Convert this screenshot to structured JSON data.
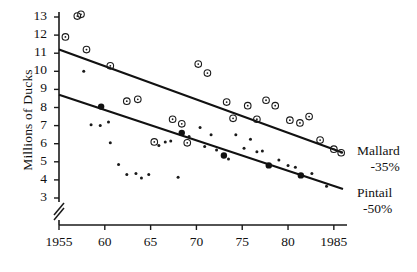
{
  "chart_data": {
    "type": "scatter",
    "title": "",
    "xlabel": "",
    "ylabel": "Millions of Ducks",
    "xlim": [
      1955,
      1986
    ],
    "ylim": [
      3,
      13
    ],
    "ybreak_below": 3,
    "grid": false,
    "legend_position": "right",
    "xticks": [
      {
        "value": 1955,
        "label": "1955"
      },
      {
        "value": 1960,
        "label": "60"
      },
      {
        "value": 1965,
        "label": "65"
      },
      {
        "value": 1970,
        "label": "70"
      },
      {
        "value": 1975,
        "label": "75"
      },
      {
        "value": 1980,
        "label": "80"
      },
      {
        "value": 1985,
        "label": "1985"
      }
    ],
    "yticks": [
      {
        "value": 13,
        "label": "13"
      },
      {
        "value": 12,
        "label": "12"
      },
      {
        "value": 11,
        "label": "11"
      },
      {
        "value": 10,
        "label": "10"
      },
      {
        "value": 9,
        "label": "9"
      },
      {
        "value": 8,
        "label": "8"
      },
      {
        "value": 7,
        "label": "7"
      },
      {
        "value": 6,
        "label": "6"
      },
      {
        "value": 5,
        "label": "5"
      },
      {
        "value": 4,
        "label": "4"
      },
      {
        "value": 3,
        "label": "3"
      }
    ],
    "series": [
      {
        "name": "Mallard",
        "marker": "open-circle",
        "annotation": "-35%",
        "legend_label": "Mallard",
        "legend_value": "-35%",
        "trend": {
          "x0": 1955,
          "y0": 11.2,
          "x1": 1986,
          "y1": 5.5,
          "style": "solid"
        },
        "points": [
          {
            "x": 1955.7,
            "y": 11.9
          },
          {
            "x": 1957.0,
            "y": 13.05
          },
          {
            "x": 1957.4,
            "y": 13.15
          },
          {
            "x": 1958.0,
            "y": 11.2
          },
          {
            "x": 1960.6,
            "y": 10.3
          },
          {
            "x": 1962.4,
            "y": 8.35
          },
          {
            "x": 1963.6,
            "y": 8.45
          },
          {
            "x": 1965.4,
            "y": 6.1
          },
          {
            "x": 1967.4,
            "y": 7.35
          },
          {
            "x": 1968.4,
            "y": 7.1
          },
          {
            "x": 1969.0,
            "y": 6.05
          },
          {
            "x": 1970.2,
            "y": 10.4
          },
          {
            "x": 1971.2,
            "y": 9.9
          },
          {
            "x": 1973.3,
            "y": 8.3
          },
          {
            "x": 1974.0,
            "y": 7.4
          },
          {
            "x": 1975.6,
            "y": 8.1
          },
          {
            "x": 1976.6,
            "y": 7.35
          },
          {
            "x": 1977.6,
            "y": 8.4
          },
          {
            "x": 1978.6,
            "y": 8.1
          },
          {
            "x": 1980.2,
            "y": 7.3
          },
          {
            "x": 1981.3,
            "y": 7.15
          },
          {
            "x": 1982.3,
            "y": 7.5
          },
          {
            "x": 1983.5,
            "y": 6.2
          },
          {
            "x": 1985.0,
            "y": 5.7
          },
          {
            "x": 1985.8,
            "y": 5.5
          }
        ]
      },
      {
        "name": "Pintail",
        "marker": "filled-dot",
        "annotation": "-50%",
        "legend_label": "Pintail",
        "legend_value": "-50%",
        "trend": {
          "x0": 1955,
          "y0": 8.7,
          "x1": 1986,
          "y1": 3.5,
          "style": "solid-with-markers"
        },
        "trend_markers": [
          {
            "x": 1959.6,
            "y": 8.05
          },
          {
            "x": 1968.4,
            "y": 6.6
          },
          {
            "x": 1973.0,
            "y": 5.35
          },
          {
            "x": 1977.9,
            "y": 4.8
          },
          {
            "x": 1981.4,
            "y": 4.25
          }
        ],
        "points": [
          {
            "x": 1957.7,
            "y": 10.0
          },
          {
            "x": 1958.5,
            "y": 7.05
          },
          {
            "x": 1959.5,
            "y": 7.0
          },
          {
            "x": 1960.4,
            "y": 7.2
          },
          {
            "x": 1960.6,
            "y": 6.05
          },
          {
            "x": 1961.5,
            "y": 4.85
          },
          {
            "x": 1962.4,
            "y": 4.3
          },
          {
            "x": 1963.4,
            "y": 4.35
          },
          {
            "x": 1964.0,
            "y": 4.1
          },
          {
            "x": 1964.8,
            "y": 4.3
          },
          {
            "x": 1965.9,
            "y": 5.9
          },
          {
            "x": 1966.6,
            "y": 6.1
          },
          {
            "x": 1967.2,
            "y": 6.15
          },
          {
            "x": 1968.0,
            "y": 4.15
          },
          {
            "x": 1969.2,
            "y": 6.4
          },
          {
            "x": 1970.4,
            "y": 6.9
          },
          {
            "x": 1970.9,
            "y": 5.85
          },
          {
            "x": 1971.6,
            "y": 6.5
          },
          {
            "x": 1972.2,
            "y": 5.65
          },
          {
            "x": 1973.5,
            "y": 5.15
          },
          {
            "x": 1974.3,
            "y": 6.5
          },
          {
            "x": 1975.2,
            "y": 5.75
          },
          {
            "x": 1975.9,
            "y": 6.25
          },
          {
            "x": 1976.6,
            "y": 5.55
          },
          {
            "x": 1977.2,
            "y": 5.6
          },
          {
            "x": 1979.0,
            "y": 5.1
          },
          {
            "x": 1980.0,
            "y": 4.8
          },
          {
            "x": 1980.8,
            "y": 4.7
          },
          {
            "x": 1982.6,
            "y": 4.35
          },
          {
            "x": 1984.2,
            "y": 3.65
          }
        ]
      }
    ]
  }
}
